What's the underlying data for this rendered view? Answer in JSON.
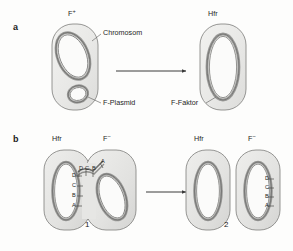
{
  "figure": {
    "background_color": "#fdfdfc",
    "cell_fill": "#e9e9e7",
    "cell_stroke": "#8a8a88",
    "chromosome_outer": "#9a9a98",
    "chromosome_inner": "#7d7d7b",
    "arrow_color": "#3a3a3a",
    "leader_color": "#6f6f6d",
    "text_color": "#262626"
  },
  "panels": [
    {
      "letter": "a",
      "cells": [
        {
          "name": "f-plus-cell",
          "label": "F",
          "superscript": "+"
        },
        {
          "name": "hfr-cell",
          "label": "Hfr",
          "superscript": ""
        }
      ],
      "callouts": [
        {
          "name": "chromosome-callout",
          "text": "Chromosom"
        },
        {
          "name": "f-plasmid-callout",
          "text": "F-Plasmid"
        },
        {
          "name": "f-faktor-callout",
          "text": "F-Faktor"
        }
      ],
      "arrow": {
        "name": "transition-arrow-a",
        "direction": "right"
      }
    },
    {
      "letter": "b",
      "stages": [
        {
          "number": "1",
          "cells": [
            {
              "name": "hfr-donor-cell",
              "label": "Hfr",
              "superscript": ""
            },
            {
              "name": "f-minus-recipient-cell",
              "label": "F",
              "superscript": "−"
            }
          ],
          "gene_markers_donor": [
            "D",
            "C",
            "B",
            "A"
          ],
          "gene_markers_bridge": [
            "D",
            "C",
            "B",
            "A"
          ]
        },
        {
          "number": "2",
          "cells": [
            {
              "name": "hfr-result-cell",
              "label": "Hfr",
              "superscript": ""
            },
            {
              "name": "f-minus-result-cell",
              "label": "F",
              "superscript": "−"
            }
          ],
          "gene_markers_recipient": [
            "D",
            "C",
            "B",
            "A"
          ]
        }
      ],
      "arrow": {
        "name": "transition-arrow-b",
        "direction": "right"
      }
    }
  ]
}
